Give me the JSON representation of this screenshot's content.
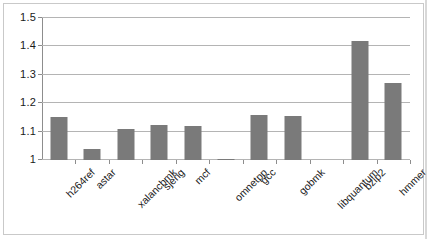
{
  "chart_data": {
    "type": "bar",
    "title": "",
    "xlabel": "",
    "ylabel": "",
    "categories": [
      "h264ref",
      "astar",
      "xalancbmk",
      "sjeng",
      "mcf",
      "omnetpp",
      "gcc",
      "gobmk",
      "libquantum",
      "bzip2",
      "hmmer"
    ],
    "values": [
      1.15,
      1.04,
      1.11,
      1.125,
      1.12,
      1.005,
      1.16,
      1.155,
      1.0,
      1.42,
      1.27
    ],
    "ylim": [
      1,
      1.5
    ],
    "yticks": [
      1,
      1.1,
      1.2,
      1.3,
      1.4,
      1.5
    ],
    "ytick_labels": [
      "1",
      "1.1",
      "1.2",
      "1.3",
      "1.4",
      "1.5"
    ],
    "grid": true,
    "legend": false,
    "legend_position": "none",
    "bar_color": "#7a7a7a",
    "gridline_color": "#b4b4b4",
    "axis_color": "#8d8d8d",
    "background_color": "#ffffff",
    "label_rotation_degrees": -45
  }
}
